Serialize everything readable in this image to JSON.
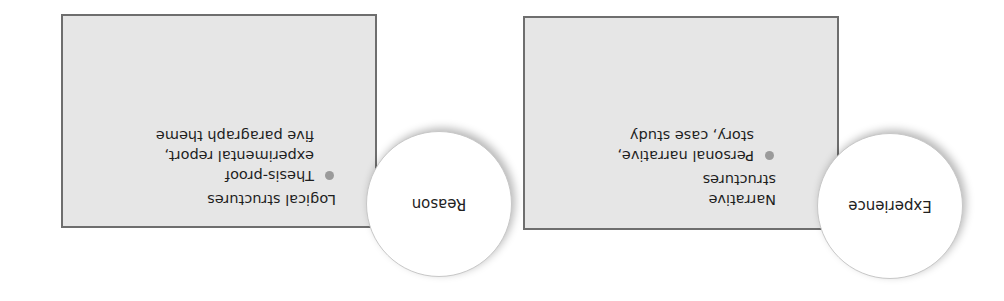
{
  "orientation": "rotated 180 degrees",
  "colors": {
    "box_fill": "#e6e6e6",
    "box_border": "#6e6e6e",
    "circle_fill": "#ffffff",
    "bullet": "#9a9a9a",
    "text": "#1e1e1e"
  },
  "panels": [
    {
      "circle_label": "Experience",
      "heading_lines": [
        "Narrative",
        "structures"
      ],
      "bullet_lines": [
        "Personal narrative,",
        "story, case study"
      ]
    },
    {
      "circle_label": "Reason",
      "heading_lines": [
        "Logical structures"
      ],
      "bullet_lines": [
        "Thesis-proof",
        "experimental report,",
        "five paragraph theme"
      ]
    }
  ]
}
